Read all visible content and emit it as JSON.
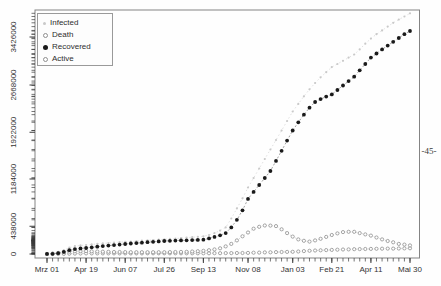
{
  "page": {
    "number_label": "-45-"
  },
  "colors": {
    "plot_border": "#848484",
    "axis_tick": "#3a3a3a",
    "tick_text": "#333333",
    "infected": "#c9c9c9",
    "death": "#8f8f8f",
    "recovered": "#1a1a1a",
    "active": "#8f8f8f"
  },
  "chart_data": {
    "type": "line",
    "title": "",
    "xlabel": "",
    "ylabel": "",
    "grid": false,
    "legend_position": "top-left",
    "x_unit": "weeks since Mrz 01",
    "weeks_total": 65,
    "days_total": 455,
    "x_tick_weeks": [
      0,
      7,
      14,
      21,
      28,
      36,
      44,
      51,
      58,
      65
    ],
    "x_tick_labels": [
      "Mrz 01",
      "Apr 19",
      "Jun 07",
      "Jul 26",
      "Sep 13",
      "Nov 08",
      "Jan 03",
      "Feb 21",
      "Apr 11",
      "Mai 30"
    ],
    "y_tick_values": [
      0,
      438000,
      1184000,
      1922000,
      2668000,
      3426000
    ],
    "y_tick_labels": [
      "0",
      "438000",
      "1184000",
      "1922000",
      "2668000",
      "3426000"
    ],
    "ylim": [
      0,
      3800000
    ],
    "series": [
      {
        "name": "Infected",
        "symbol": "small-dot",
        "color": "#c9c9c9",
        "values": [
          2000,
          8000,
          25000,
          60000,
          100000,
          125000,
          135000,
          142000,
          152000,
          160000,
          167000,
          174000,
          180000,
          186000,
          192000,
          198000,
          204000,
          210000,
          215000,
          221000,
          226000,
          232000,
          238000,
          245000,
          251000,
          258000,
          265000,
          272000,
          280000,
          300000,
          330000,
          370000,
          420000,
          560000,
          720000,
          880000,
          1050000,
          1200000,
          1350000,
          1500000,
          1650000,
          1800000,
          1950000,
          2100000,
          2250000,
          2370000,
          2490000,
          2600000,
          2700000,
          2790000,
          2870000,
          2950000,
          3000000,
          3050000,
          3100000,
          3150000,
          3230000,
          3320000,
          3400000,
          3470000,
          3530000,
          3590000,
          3650000,
          3700000,
          3750000,
          3800000
        ]
      },
      {
        "name": "Death",
        "symbol": "open-circle",
        "color": "#8f8f8f",
        "values": [
          0,
          100,
          500,
          2000,
          4000,
          6000,
          8000,
          9000,
          9200,
          9400,
          9500,
          9600,
          9700,
          9800,
          9900,
          10000,
          10100,
          10200,
          10300,
          10400,
          10500,
          10600,
          10700,
          10800,
          10900,
          11000,
          11100,
          11300,
          11500,
          11800,
          12200,
          12800,
          13500,
          14300,
          15300,
          16500,
          18000,
          20000,
          22500,
          25000,
          27500,
          30000,
          32000,
          33500,
          35000,
          40000,
          45000,
          50000,
          55000,
          59000,
          62000,
          65000,
          68000,
          70500,
          73000,
          75000,
          77000,
          78500,
          80000,
          81500,
          83000,
          84500,
          86000,
          87500,
          89000,
          90000
        ]
      },
      {
        "name": "Recovered",
        "symbol": "filled-dot",
        "color": "#1a1a1a",
        "values": [
          1000,
          3000,
          12000,
          35000,
          60000,
          78000,
          88000,
          95000,
          105000,
          115000,
          124000,
          132000,
          140000,
          149000,
          158000,
          165000,
          172000,
          179000,
          186000,
          192000,
          199000,
          205000,
          208000,
          211000,
          214000,
          217000,
          219000,
          222000,
          225000,
          247000,
          270000,
          296000,
          330000,
          420000,
          540000,
          690000,
          870000,
          980000,
          1090000,
          1200000,
          1310000,
          1470000,
          1630000,
          1790000,
          1950000,
          2080000,
          2200000,
          2310000,
          2400000,
          2445000,
          2485000,
          2520000,
          2590000,
          2660000,
          2730000,
          2800000,
          2900000,
          3000000,
          3100000,
          3165000,
          3230000,
          3290000,
          3350000,
          3410000,
          3470000,
          3520000
        ]
      },
      {
        "name": "Active",
        "symbol": "open-circle",
        "color": "#8f8f8f",
        "values": [
          1000,
          8000,
          18000,
          30000,
          38000,
          42000,
          44000,
          45000,
          42000,
          39000,
          36000,
          34000,
          32000,
          31000,
          30000,
          29000,
          28000,
          28000,
          28000,
          28000,
          28000,
          28000,
          30000,
          31000,
          33000,
          35000,
          39000,
          44000,
          50000,
          60000,
          73000,
          90000,
          120000,
          160000,
          215000,
          280000,
          340000,
          400000,
          430000,
          450000,
          448000,
          440000,
          390000,
          330000,
          275000,
          230000,
          208000,
          195000,
          215000,
          240000,
          270000,
          300000,
          325000,
          345000,
          350000,
          350000,
          330000,
          310000,
          290000,
          260000,
          230000,
          205000,
          185000,
          160000,
          148000,
          135000
        ]
      }
    ]
  }
}
